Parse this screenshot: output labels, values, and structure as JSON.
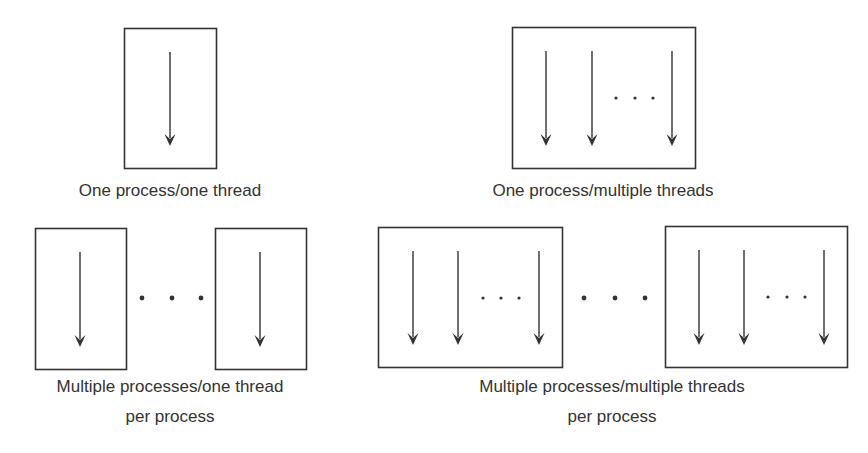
{
  "figure": {
    "stroke_color": "#333333",
    "background": "#ffffff"
  },
  "panels": [
    {
      "id": "one-process-one-thread",
      "label_lines": [
        "One process/one thread"
      ],
      "label_x": 170,
      "label_y": [
        196
      ],
      "processes": [
        {
          "box": [
            124,
            28,
            92,
            140
          ],
          "threads": [
            170
          ],
          "thread_dots": []
        }
      ],
      "process_dots": []
    },
    {
      "id": "one-process-multiple-threads",
      "label_lines": [
        "One process/multiple threads"
      ],
      "label_x": 603,
      "label_y": [
        196
      ],
      "processes": [
        {
          "box": [
            512,
            27,
            183,
            141
          ],
          "threads": [
            546,
            592,
            672
          ],
          "thread_dots": [
            616,
            635,
            653
          ]
        }
      ],
      "process_dots": []
    },
    {
      "id": "multiple-processes-one-thread",
      "label_lines": [
        "Multiple processes/one thread",
        "per process"
      ],
      "label_x": 170,
      "label_y": [
        392,
        422
      ],
      "processes": [
        {
          "box": [
            35,
            228,
            91,
            141
          ],
          "threads": [
            80
          ],
          "thread_dots": []
        },
        {
          "box": [
            215,
            228,
            91,
            141
          ],
          "threads": [
            260
          ],
          "thread_dots": []
        }
      ],
      "process_dots": [
        142,
        172,
        201
      ]
    },
    {
      "id": "multiple-processes-multiple-threads",
      "label_lines": [
        "Multiple processes/multiple threads",
        "per process"
      ],
      "label_x": 612,
      "label_y": [
        392,
        422
      ],
      "processes": [
        {
          "box": [
            378,
            227,
            184,
            140
          ],
          "threads": [
            413,
            458,
            539
          ],
          "thread_dots": [
            483,
            501,
            519
          ]
        },
        {
          "box": [
            665,
            226,
            182,
            141
          ],
          "threads": [
            699,
            744,
            824
          ],
          "thread_dots": [
            768,
            787,
            805
          ]
        }
      ],
      "process_dots": [
        584,
        615,
        645
      ]
    }
  ]
}
